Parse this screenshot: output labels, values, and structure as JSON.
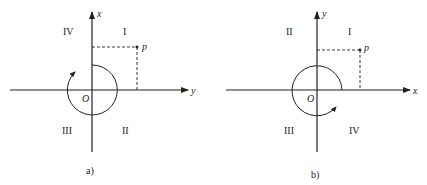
{
  "diagrams": [
    {
      "id": "a",
      "caption": "a)",
      "vertical_axis_label": "x",
      "horizontal_axis_label": "y",
      "origin_label": "O",
      "point_label": "p",
      "quadrants": {
        "top_left": "IV",
        "top_right": "I",
        "bottom_left": "III",
        "bottom_right": "II"
      },
      "rotation": "clockwise"
    },
    {
      "id": "b",
      "caption": "b)",
      "vertical_axis_label": "y",
      "horizontal_axis_label": "x",
      "origin_label": "O",
      "point_label": "p",
      "quadrants": {
        "top_left": "II",
        "top_right": "I",
        "bottom_left": "III",
        "bottom_right": "IV"
      },
      "rotation": "counterclockwise"
    }
  ],
  "colors": {
    "line": "#222222",
    "background": "#ffffff"
  }
}
